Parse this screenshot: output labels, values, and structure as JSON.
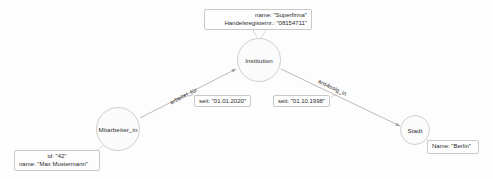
{
  "diagram": {
    "type": "property-graph",
    "nodes": [
      {
        "id": "institution",
        "label": "Institution"
      },
      {
        "id": "mitarbeiter",
        "label": "Mitarbeiter_in"
      },
      {
        "id": "stadt",
        "label": "Stadt"
      }
    ],
    "node_attributes": [
      {
        "id": "institution-attrs",
        "owner": "Institution",
        "lines": [
          "name: \"Superfirma\"",
          "Handelsregisternr.: \"08154711\""
        ]
      },
      {
        "id": "mitarbeiter-attrs",
        "owner": "Mitarbeiter_in",
        "lines": [
          "id: \"42\"",
          "name: \"Max Mustermann\""
        ]
      },
      {
        "id": "stadt-attrs",
        "owner": "Stadt",
        "lines": [
          "Name: \"Berlin\""
        ]
      }
    ],
    "edges": [
      {
        "id": "arbeitet-fuer",
        "label": "arbeitet_für",
        "from": "Mitarbeiter_in",
        "to": "Institution",
        "property": "seit: \"01.01.2020\""
      },
      {
        "id": "ansaessig-in",
        "label": "ansässig_in",
        "from": "Institution",
        "to": "Stadt",
        "property": "seit: \"01.10.1998\""
      }
    ],
    "colors": {
      "background": "#fdfdfd",
      "node_fill": "#fbfbfb",
      "node_stroke": "#cfcfcf",
      "edge_stroke": "#a8a8a8",
      "box_stroke": "#c9c9c9",
      "text": "#2b2b2b"
    }
  }
}
